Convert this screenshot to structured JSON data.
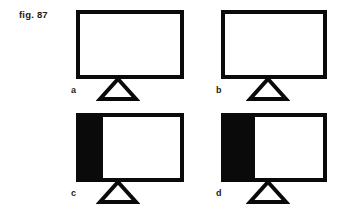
{
  "figure": {
    "caption": "fig. 87",
    "caption_position": {
      "x": 19,
      "y": 9
    },
    "canvas": {
      "width": 343,
      "height": 217
    },
    "colors": {
      "ink": "#0a0a0a",
      "text": "#1b1b1b",
      "background": "#ffffff",
      "fill": "#0a0a0a"
    },
    "stroke_width_px": 4
  },
  "panels": [
    {
      "id": "a",
      "label": "a",
      "beam": {
        "x": 76,
        "y": 10,
        "width": 108,
        "height": 69
      },
      "fill": {
        "present": false,
        "side": "none",
        "width": 0,
        "fraction": 0
      },
      "fulcrum": {
        "cx": 118,
        "top": 79,
        "half_base": 18,
        "height": 20
      },
      "label_position": {
        "x": 71,
        "y": 85
      }
    },
    {
      "id": "b",
      "label": "b",
      "beam": {
        "x": 221,
        "y": 10,
        "width": 106,
        "height": 69
      },
      "fill": {
        "present": false,
        "side": "none",
        "width": 0,
        "fraction": 0
      },
      "fulcrum": {
        "cx": 268,
        "top": 79,
        "half_base": 18,
        "height": 20
      },
      "label_position": {
        "x": 216,
        "y": 85
      }
    },
    {
      "id": "c",
      "label": "c",
      "beam": {
        "x": 76,
        "y": 113,
        "width": 108,
        "height": 69
      },
      "fill": {
        "present": true,
        "side": "left",
        "width": 27,
        "fraction": 0.25
      },
      "fulcrum": {
        "cx": 118,
        "top": 182,
        "half_base": 18,
        "height": 20
      },
      "label_position": {
        "x": 71,
        "y": 188
      }
    },
    {
      "id": "d",
      "label": "d",
      "beam": {
        "x": 221,
        "y": 113,
        "width": 106,
        "height": 69
      },
      "fill": {
        "present": true,
        "side": "left",
        "width": 34,
        "fraction": 0.32
      },
      "fulcrum": {
        "cx": 268,
        "top": 182,
        "half_base": 18,
        "height": 20
      },
      "label_position": {
        "x": 216,
        "y": 188
      }
    }
  ]
}
